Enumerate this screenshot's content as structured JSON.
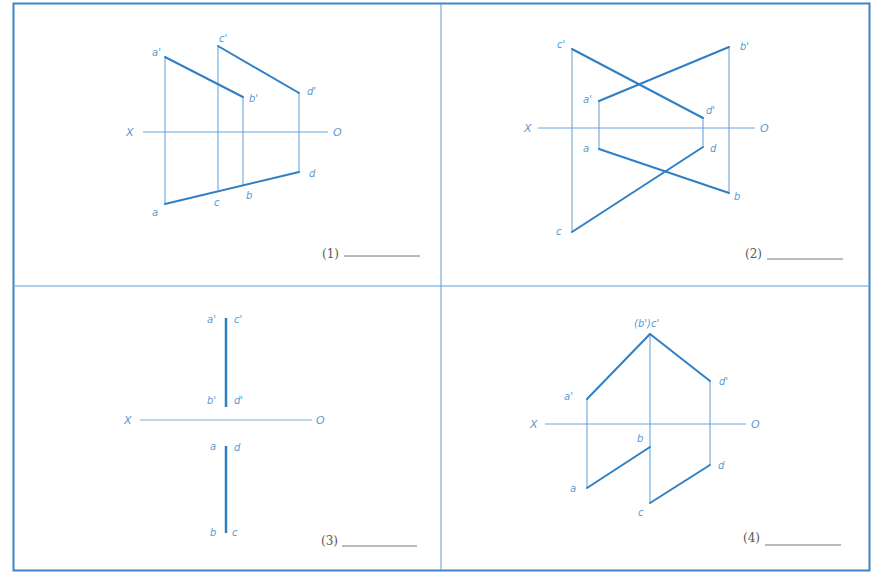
{
  "colors": {
    "border": "#3d85c6",
    "thick_line": "#2f7fc4",
    "thin_line": "#5d9fd6",
    "axis_line": "#6aa6d8",
    "label": "#5a9bd3",
    "number": "#555555",
    "blank": "#777777"
  },
  "panels": [
    {
      "id": "1",
      "number_label": "(1)",
      "axis": {
        "x_label": "X",
        "o_label": "O"
      },
      "points": {
        "a_prime": "a'",
        "b_prime": "b'",
        "c_prime": "c'",
        "d_prime": "d'",
        "a": "a",
        "b": "b",
        "c": "c",
        "d": "d"
      }
    },
    {
      "id": "2",
      "number_label": "(2)",
      "axis": {
        "x_label": "X",
        "o_label": "O"
      },
      "points": {
        "a_prime": "a'",
        "b_prime": "b'",
        "c_prime": "c'",
        "d_prime": "d'",
        "a": "a",
        "b": "b",
        "c": "c",
        "d": "d"
      }
    },
    {
      "id": "3",
      "number_label": "(3)",
      "axis": {
        "x_label": "X",
        "o_label": "O"
      },
      "points": {
        "a_prime": "a'",
        "c_prime": "c'",
        "b_prime": "b'",
        "d_prime": "d'",
        "a": "a",
        "d": "d",
        "b": "b",
        "c": "c"
      }
    },
    {
      "id": "4",
      "number_label": "(4)",
      "axis": {
        "x_label": "X",
        "o_label": "O"
      },
      "points": {
        "bc_prime": "(b')c'",
        "a_prime": "a'",
        "d_prime": "d'",
        "a": "a",
        "b": "b",
        "c": "c",
        "d": "d"
      }
    }
  ]
}
